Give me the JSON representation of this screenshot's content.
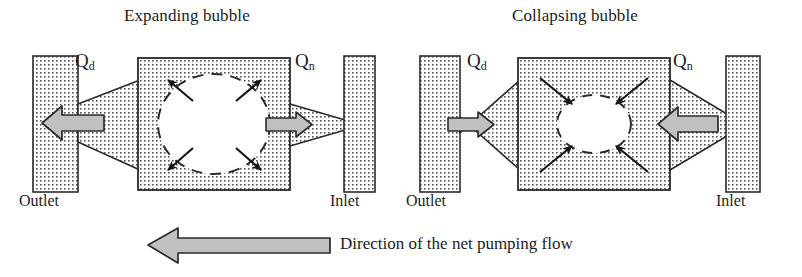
{
  "figure": {
    "type": "bubble-micropump-schematic",
    "background_color": "#ffffff",
    "stroke_color": "#2b2b2b",
    "arrow_fill_color": "#bdbdbd",
    "hatch_dot_color": "#4a4a4a"
  },
  "panels": [
    {
      "id": "expanding",
      "title": "Expanding bubble",
      "bubble_state": "expanding",
      "bubble_arrow_direction": "outward",
      "flow_labels": {
        "outlet_side": "Q",
        "outlet_sub": "d",
        "inlet_side": "Q",
        "inlet_sub": "n"
      },
      "ports": {
        "left": "Outlet",
        "right": "Inlet"
      },
      "outlet_flow_arrow": {
        "direction": "left",
        "size": "large"
      },
      "inlet_flow_arrow": {
        "direction": "right",
        "size": "small"
      }
    },
    {
      "id": "collapsing",
      "title": "Collapsing bubble",
      "bubble_state": "collapsing",
      "bubble_arrow_direction": "inward",
      "flow_labels": {
        "outlet_side": "Q",
        "outlet_sub": "d",
        "inlet_side": "Q",
        "inlet_sub": "n"
      },
      "ports": {
        "left": "Outlet",
        "right": "Inlet"
      },
      "outlet_flow_arrow": {
        "direction": "right",
        "size": "small"
      },
      "inlet_flow_arrow": {
        "direction": "left",
        "size": "large"
      }
    }
  ],
  "caption": {
    "text": "Direction of the net pumping flow",
    "arrow_direction": "left"
  }
}
